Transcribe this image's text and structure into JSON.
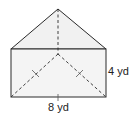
{
  "diagram": {
    "type": "geometry-figure",
    "shape": "triangular-prism-net",
    "labels": {
      "height": "4 yd",
      "base": "8 yd"
    },
    "colors": {
      "stroke": "#2a2a2a",
      "fill": "#f2f2f2",
      "background": "#ffffff"
    }
  }
}
